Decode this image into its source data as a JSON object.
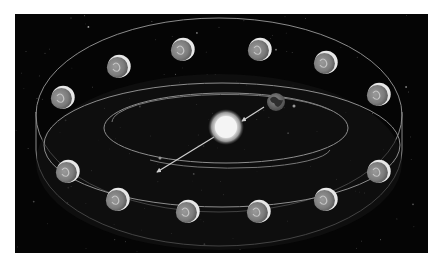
{
  "scene": {
    "title": "",
    "description": "Zodiac band around the Sun with Earth orbiting",
    "background_color": "#050505",
    "line_color": "#8a8a8a",
    "sun": {
      "name": "Sun",
      "color": "#f2f2f2"
    },
    "earth": {
      "name": "Earth",
      "color": "#7a7a7a"
    },
    "zodiac": [
      {
        "sign": "Aquarius",
        "row": "top",
        "index": 0
      },
      {
        "sign": "Pisces",
        "row": "top",
        "index": 1
      },
      {
        "sign": "Aries",
        "row": "top",
        "index": 2
      },
      {
        "sign": "Taurus",
        "row": "top",
        "index": 3
      },
      {
        "sign": "Gemini",
        "row": "top",
        "index": 4
      },
      {
        "sign": "Cancer",
        "row": "top",
        "index": 5
      },
      {
        "sign": "Capricorn",
        "row": "bottom",
        "index": 0
      },
      {
        "sign": "Sagittarius",
        "row": "bottom",
        "index": 1
      },
      {
        "sign": "Scorpio",
        "row": "bottom",
        "index": 2
      },
      {
        "sign": "Libra",
        "row": "bottom",
        "index": 3
      },
      {
        "sign": "Virgo",
        "row": "bottom",
        "index": 4
      },
      {
        "sign": "Leo",
        "row": "bottom",
        "index": 5
      }
    ]
  }
}
